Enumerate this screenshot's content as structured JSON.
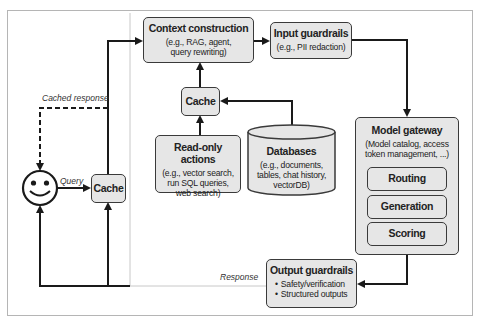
{
  "diagram": {
    "nodes": {
      "context_construction": {
        "title": "Context construction",
        "subtitle_line1": "(e.g., RAG, agent,",
        "subtitle_line2": "query rewriting)"
      },
      "input_guardrails": {
        "title": "Input guardrails",
        "subtitle": "(e.g., PII redaction)"
      },
      "cache_top": {
        "title": "Cache"
      },
      "read_only_actions": {
        "title": "Read-only actions",
        "subtitle_line1": "(e.g., vector search,",
        "subtitle_line2": "run SQL queries,",
        "subtitle_line3": "web search)"
      },
      "databases": {
        "title": "Databases",
        "subtitle_line1": "(e.g., documents,",
        "subtitle_line2": "tables, chat history,",
        "subtitle_line3": "vectorDB)"
      },
      "model_gateway": {
        "title": "Model gateway",
        "subtitle_line1": "(Model catalog, access",
        "subtitle_line2": "token management, ...)",
        "components": [
          "Routing",
          "Generation",
          "Scoring"
        ]
      },
      "output_guardrails": {
        "title": "Output guardrails",
        "bullets": [
          "Safety/verification",
          "Structured outputs"
        ]
      },
      "cache_left": {
        "title": "Cache"
      },
      "user": {
        "icon": "smiley-face-icon"
      }
    },
    "edge_labels": {
      "cached_response": "Cached response",
      "query": "Query",
      "response": "Response"
    },
    "colors": {
      "box_fill": "#e6e6e6",
      "stroke": "#1a1a1a",
      "frame": "#b5b5b5",
      "response_line": "#c8c8c8"
    }
  }
}
